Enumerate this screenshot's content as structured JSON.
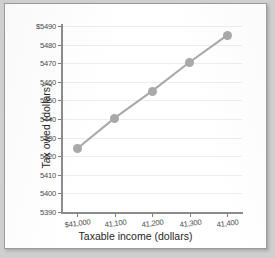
{
  "chart_data": {
    "type": "line",
    "title": "",
    "xlabel": "Taxable income (dollars)",
    "ylabel": "Tax owed (dollars)",
    "x": [
      41000,
      41100,
      41200,
      41300,
      41400
    ],
    "values": [
      5424,
      5440.5,
      5455,
      5470.5,
      5485
    ],
    "xtick_labels": [
      "$41,000",
      "41,100",
      "41,200",
      "41,300",
      "41,400"
    ],
    "ytick_labels": [
      "$5490",
      "5480",
      "5470",
      "5460",
      "5450",
      "5440",
      "5430",
      "5420",
      "5410",
      "5400",
      "5390"
    ],
    "ytick_values": [
      5490,
      5480,
      5470,
      5460,
      5450,
      5440,
      5430,
      5420,
      5410,
      5400,
      5390
    ],
    "xlim": [
      40960,
      41440
    ],
    "ylim": [
      5390,
      5490
    ],
    "grid": true,
    "legend": "none",
    "series_color": "#a9a9a9",
    "marker_color": "#a9a9a9",
    "grid_color": "#ededed",
    "axis_color": "#8c8c8c"
  }
}
